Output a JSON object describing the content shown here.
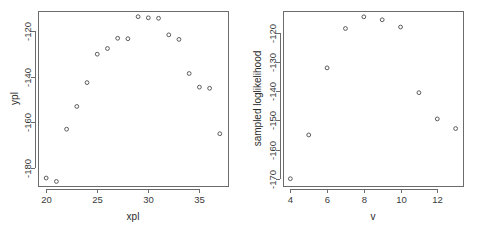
{
  "figure": {
    "background": "#ffffff",
    "marker_color": "#5a5a5a",
    "axis_color": "#6b6b6b",
    "text_color": "#2b2b2b",
    "panel_count": 2
  },
  "chart_data": [
    {
      "type": "scatter",
      "id": "left-panel",
      "title": "",
      "xlabel": "xpl",
      "ylabel": "ypl",
      "xlim": [
        19.2,
        37.8
      ],
      "ylim": [
        -188,
        -111
      ],
      "xticks": [
        20,
        25,
        30,
        35
      ],
      "xtick_labels": [
        "20",
        "25",
        "30",
        "35"
      ],
      "yticks": [
        -180,
        -160,
        -140,
        -120
      ],
      "ytick_labels": [
        "-180",
        "-160",
        "-140",
        "-120"
      ],
      "grid": false,
      "legend": null,
      "marker": "open-circle",
      "x": [
        20,
        21,
        22,
        23,
        24,
        25,
        26,
        27,
        28,
        29,
        30,
        31,
        32,
        33,
        34,
        35,
        36,
        37
      ],
      "y": [
        -184.5,
        -186.0,
        -163.0,
        -153.0,
        -142.5,
        -130.0,
        -127.5,
        -123.0,
        -123.2,
        -113.5,
        -114.0,
        -114.2,
        -121.5,
        -123.5,
        -138.5,
        -144.5,
        -145.0,
        -165.0
      ]
    },
    {
      "type": "scatter",
      "id": "right-panel",
      "title": "",
      "xlabel": "v",
      "ylabel": "sampled loglikelihood",
      "xlim": [
        3.6,
        13.4
      ],
      "ylim": [
        -172.5,
        -112.5
      ],
      "xticks": [
        4,
        6,
        8,
        10,
        12
      ],
      "xtick_labels": [
        "4",
        "6",
        "8",
        "10",
        "12"
      ],
      "yticks": [
        -170,
        -160,
        -150,
        -140,
        -130,
        -120
      ],
      "ytick_labels": [
        "-170",
        "-160",
        "-150",
        "-140",
        "-130",
        "-120"
      ],
      "grid": false,
      "legend": null,
      "marker": "open-circle",
      "x": [
        4,
        5,
        6,
        7,
        8,
        9,
        10,
        11,
        12,
        13
      ],
      "y": [
        -170.0,
        -155.0,
        -132.0,
        -118.5,
        -114.5,
        -115.5,
        -118.0,
        -140.5,
        -149.5,
        -152.8
      ]
    }
  ]
}
